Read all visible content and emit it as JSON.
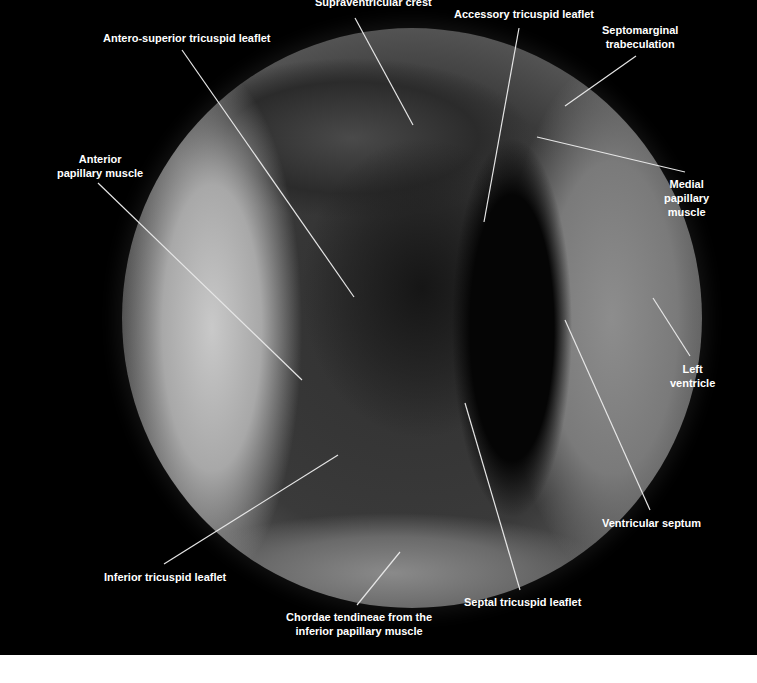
{
  "figure": {
    "background_color": "#000000",
    "label_color": "#ffffff",
    "leader_line_color": "#e6e6e6",
    "labels": {
      "supraventricular_crest": "Supraventricular crest",
      "accessory_tricuspid_leaflet": "Accessory tricuspid leaflet",
      "septomarginal_trabeculation": [
        "Septomarginal",
        "trabeculation"
      ],
      "antero_superior_tricuspid_leaflet": "Antero-superior tricuspid leaflet",
      "anterior_papillary_muscle": [
        "Anterior",
        "papillary muscle"
      ],
      "medial_papillary_muscle": [
        "Medial",
        "papillary",
        "muscle"
      ],
      "left_ventricle": [
        "Left",
        "ventricle"
      ],
      "ventricular_septum": "Ventricular septum",
      "inferior_tricuspid_leaflet": "Inferior tricuspid leaflet",
      "septal_tricuspid_leaflet": "Septal tricuspid leaflet",
      "chordae_tendineae": [
        "Chordae tendineae from the",
        "inferior papillary muscle"
      ]
    }
  }
}
